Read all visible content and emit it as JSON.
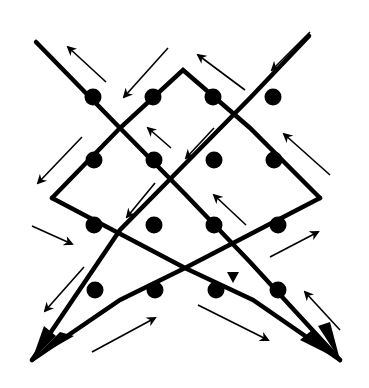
{
  "diagram": {
    "colors": {
      "stroke": "#000000",
      "background": "#ffffff"
    },
    "strands": [
      {
        "name": "strand-a",
        "points": [
          [
            36,
            42
          ],
          [
            120,
            128
          ],
          [
            52,
            198
          ],
          [
            185,
            268
          ],
          [
            32,
            360
          ],
          [
            95,
            290
          ],
          [
            213,
            97
          ],
          [
            275,
            42
          ]
        ]
      }
    ],
    "chains": [
      {
        "name": "chain-left",
        "width": 5,
        "points": [
          [
            36,
            42
          ],
          [
            120,
            128
          ],
          [
            52,
            198
          ],
          [
            250,
            278
          ],
          [
            340,
            360
          ],
          [
            258,
            282
          ],
          [
            183,
            72
          ],
          [
            120,
            128
          ]
        ]
      }
    ],
    "path_a": [
      [
        36,
        42
      ],
      [
        185,
        194
      ],
      [
        120,
        262
      ]
    ],
    "dots": [
      [
        93,
        97
      ],
      [
        153,
        97
      ],
      [
        213,
        97
      ],
      [
        273,
        97
      ],
      [
        94,
        160
      ],
      [
        154,
        160
      ],
      [
        214,
        160
      ],
      [
        274,
        160
      ],
      [
        94,
        225
      ],
      [
        154,
        225
      ],
      [
        214,
        225
      ],
      [
        278,
        225
      ],
      [
        95,
        290
      ],
      [
        155,
        290
      ],
      [
        216,
        290
      ],
      [
        278,
        290
      ]
    ],
    "arrows": [
      {
        "from": [
          106,
          82
        ],
        "to": [
          68,
          47
        ]
      },
      {
        "from": [
          168,
          48
        ],
        "to": [
          124,
          97
        ]
      },
      {
        "from": [
          245,
          90
        ],
        "to": [
          198,
          55
        ]
      },
      {
        "from": [
          310,
          32
        ],
        "to": [
          272,
          70
        ]
      },
      {
        "from": [
          82,
          137
        ],
        "to": [
          38,
          183
        ]
      },
      {
        "from": [
          171,
          148
        ],
        "to": [
          148,
          128
        ]
      },
      {
        "from": [
          214,
          128
        ],
        "to": [
          186,
          158
        ]
      },
      {
        "from": [
          330,
          175
        ],
        "to": [
          284,
          134
        ]
      },
      {
        "from": [
          32,
          226
        ],
        "to": [
          72,
          244
        ]
      },
      {
        "from": [
          155,
          183
        ],
        "to": [
          127,
          217
        ]
      },
      {
        "from": [
          246,
          225
        ],
        "to": [
          214,
          195
        ]
      },
      {
        "from": [
          270,
          257
        ],
        "to": [
          318,
          232
        ]
      },
      {
        "from": [
          84,
          267
        ],
        "to": [
          45,
          311
        ]
      },
      {
        "from": [
          92,
          352
        ],
        "to": [
          155,
          318
        ]
      },
      {
        "from": [
          198,
          305
        ],
        "to": [
          268,
          340
        ]
      },
      {
        "from": [
          340,
          330
        ],
        "to": [
          305,
          292
        ]
      }
    ],
    "small_arrowhead": {
      "at": [
        233,
        277
      ],
      "direction": "down"
    }
  }
}
